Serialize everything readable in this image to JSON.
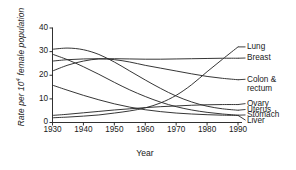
{
  "chart_data": {
    "type": "line",
    "title": "",
    "xlabel": "Year",
    "ylabel": "Rate per 10⁴ female population",
    "ylabel_prefix": "Rate per 10",
    "ylabel_exponent": "4",
    "ylabel_suffix": " female population",
    "xlim": [
      1928,
      1992
    ],
    "ylim": [
      0,
      42
    ],
    "xticks": [
      1930,
      1940,
      1950,
      1960,
      1970,
      1980,
      1990
    ],
    "yticks": [
      0,
      10,
      20,
      30,
      40
    ],
    "grid": false,
    "legend_position": "right-inline-labels",
    "line_color": "#2b2b2b",
    "axis_color": "#1a1a1a",
    "x": [
      1930,
      1935,
      1940,
      1945,
      1950,
      1955,
      1960,
      1965,
      1970,
      1975,
      1980,
      1985,
      1990
    ],
    "series": [
      {
        "name": "Lung",
        "label": "Lung",
        "label_y_value": 32.0,
        "values": [
          2.0,
          2.3,
          2.7,
          3.2,
          4.0,
          4.9,
          6.2,
          8.3,
          11.5,
          16.0,
          21.5,
          26.8,
          32.0
        ]
      },
      {
        "name": "Breast",
        "label": "Breast",
        "label_y_value": 27.3,
        "values": [
          26.0,
          26.6,
          26.9,
          27.0,
          27.0,
          26.9,
          26.8,
          26.8,
          26.9,
          27.0,
          27.1,
          27.2,
          27.2
        ]
      },
      {
        "name": "Colon & rectum",
        "label": "Colon & rectum",
        "label_y_value": 18.3,
        "values": [
          21.8,
          24.3,
          26.0,
          26.9,
          26.6,
          25.6,
          24.2,
          23.0,
          21.8,
          20.6,
          19.5,
          18.7,
          18.1
        ]
      },
      {
        "name": "Ovary",
        "label": "Ovary",
        "label_y_value": 8.0,
        "values": [
          3.0,
          3.5,
          4.1,
          4.7,
          5.3,
          5.8,
          6.3,
          6.7,
          7.0,
          7.3,
          7.5,
          7.6,
          7.6
        ]
      },
      {
        "name": "Uterus",
        "label": "Uterus",
        "label_y_value": 5.5,
        "values": [
          31.0,
          31.5,
          30.8,
          28.8,
          25.6,
          21.8,
          18.0,
          14.4,
          11.2,
          8.7,
          6.9,
          5.8,
          5.2
        ]
      },
      {
        "name": "Stomach",
        "label": "Stomach",
        "label_y_value": 3.2,
        "values": [
          28.9,
          26.5,
          23.6,
          20.4,
          17.0,
          13.8,
          11.0,
          8.6,
          6.7,
          5.3,
          4.3,
          3.6,
          3.1
        ]
      },
      {
        "name": "Liver",
        "label": "Liver",
        "label_y_value": 1.0,
        "values": [
          15.8,
          13.6,
          11.5,
          9.6,
          7.9,
          6.5,
          5.4,
          4.6,
          4.0,
          3.6,
          3.3,
          3.1,
          3.0
        ]
      }
    ]
  }
}
